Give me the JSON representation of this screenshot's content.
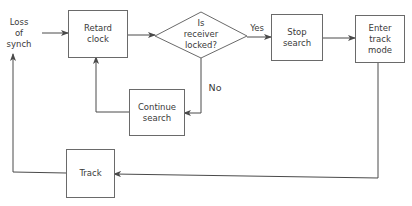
{
  "diagram": {
    "type": "flowchart",
    "nodes": {
      "loss_of_synch": {
        "lines": [
          "Loss",
          "of",
          "synch"
        ]
      },
      "retard_clock": {
        "lines": [
          "Retard",
          "clock"
        ]
      },
      "is_receiver_locked": {
        "lines": [
          "Is",
          "receiver",
          "locked?"
        ],
        "shape": "diamond"
      },
      "stop_search": {
        "lines": [
          "Stop",
          "search"
        ]
      },
      "enter_track_mode": {
        "lines": [
          "Enter",
          "track",
          "mode"
        ]
      },
      "continue_search": {
        "lines": [
          "Continue",
          "search"
        ]
      },
      "track": {
        "lines": [
          "Track"
        ]
      }
    },
    "edge_labels": {
      "yes": "Yes",
      "no": "No"
    },
    "edges": [
      {
        "from": "Loss of synch",
        "to": "Retard clock"
      },
      {
        "from": "Retard clock",
        "to": "Is receiver locked?"
      },
      {
        "from": "Is receiver locked?",
        "to": "Stop search",
        "label": "Yes"
      },
      {
        "from": "Is receiver locked?",
        "to": "Continue search",
        "label": "No"
      },
      {
        "from": "Continue search",
        "to": "Retard clock"
      },
      {
        "from": "Stop search",
        "to": "Enter track mode"
      },
      {
        "from": "Enter track mode",
        "to": "Track"
      },
      {
        "from": "Track",
        "to": "Loss of synch"
      }
    ],
    "colors": {
      "line": "#4a4a4a",
      "box_border": "#6a6a6a",
      "text": "#3a3a3a",
      "background": "#ffffff"
    }
  }
}
